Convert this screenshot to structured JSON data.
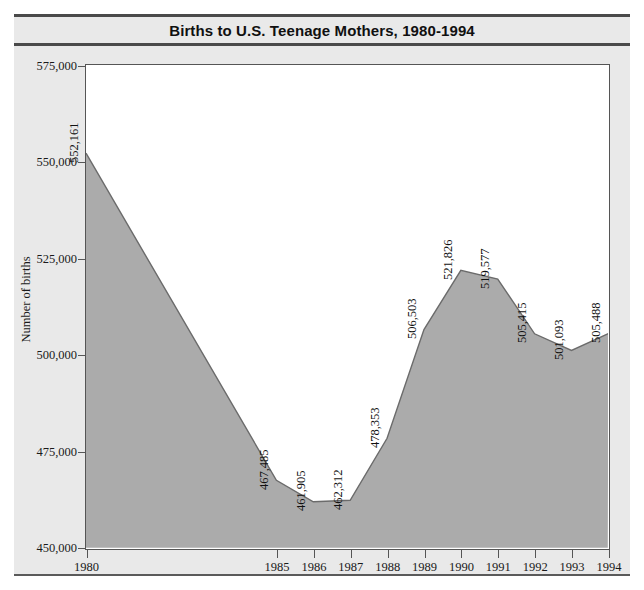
{
  "chart_data": {
    "type": "area",
    "title": "Births to U.S. Teenage Mothers, 1980-1994",
    "xlabel": "",
    "ylabel": "Number of births",
    "ylim": [
      450000,
      575000
    ],
    "ytick_labels": [
      "450,000",
      "475,000",
      "500,000",
      "525,000",
      "550,000",
      "575,000"
    ],
    "ytick_values": [
      450000,
      475000,
      500000,
      525000,
      550000,
      575000
    ],
    "grid": false,
    "legend": "none",
    "categories": [
      "1980",
      "1985",
      "1986",
      "1987",
      "1988",
      "1989",
      "1990",
      "1991",
      "1992",
      "1993",
      "1994"
    ],
    "values": [
      552161,
      467485,
      461905,
      462312,
      478353,
      506503,
      521826,
      519577,
      505415,
      501093,
      505488
    ],
    "data_labels": [
      "552,161",
      "467,485",
      "461,905",
      "462,312",
      "478,353",
      "506,503",
      "521,826",
      "519,577",
      "505,415",
      "501,093",
      "505,488"
    ],
    "xtick_labels": [
      "1980",
      "1985",
      "1986",
      "1987",
      "1988",
      "1989",
      "1990",
      "1991",
      "1992",
      "1993",
      "1994"
    ],
    "colors": {
      "area_fill": "#ababab",
      "area_line": "#6b6b6b",
      "plot_background": "#ffffff",
      "panel_background": "#e9e9e9",
      "axis": "#555555",
      "text": "#111111",
      "rule": "#4a4a4a"
    }
  },
  "figure": {
    "title": "Births to U.S. Teenage Mothers, 1980-1994",
    "y_axis_title": "Number of births",
    "source_note": ""
  }
}
